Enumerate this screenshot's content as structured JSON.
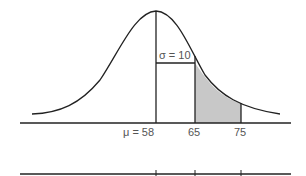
{
  "figure": {
    "type": "normal-distribution-diagram",
    "mean_label": "μ = 58",
    "sigma_label": "σ = 10",
    "tick_labels": [
      "65",
      "75"
    ],
    "shaded_region": {
      "from": 65,
      "to": 75
    },
    "colors": {
      "line": "#222222",
      "shade": "#c8c8c8",
      "label": "#555555",
      "background": "#ffffff"
    }
  }
}
